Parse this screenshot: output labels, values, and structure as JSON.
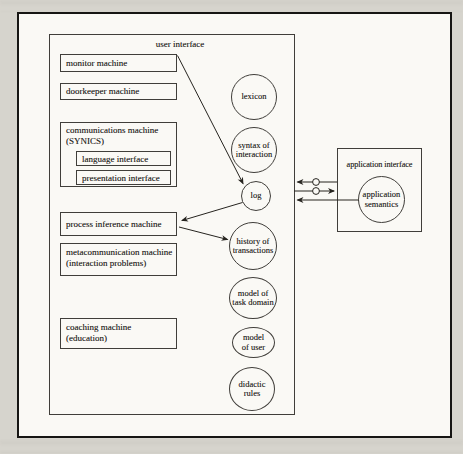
{
  "colors": {
    "ink": "#26241f",
    "paper": "#faf9f5",
    "margin": "#d6d4cd"
  },
  "user_interface": {
    "label": "user interface",
    "machines": {
      "monitor": {
        "line1": "monitor machine"
      },
      "doorkeeper": {
        "line1": "doorkeeper machine"
      },
      "communications": {
        "line1": "communications machine",
        "line2": "(SYNICS)"
      },
      "language": {
        "line1": "language interface"
      },
      "presentation": {
        "line1": "presentation interface"
      },
      "process_inference": {
        "line1": "process inference machine"
      },
      "metacommunication": {
        "line1": "metacommunication machine",
        "line2": "(interaction problems)"
      },
      "coaching": {
        "line1": "coaching machine",
        "line2": "(education)"
      }
    },
    "knowledge_stores": {
      "lexicon": {
        "line1": "lexicon"
      },
      "syntax": {
        "line1": "syntax of",
        "line2": "interaction"
      },
      "log": {
        "line1": "log"
      },
      "history": {
        "line1": "history of",
        "line2": "transactions"
      },
      "model_task": {
        "line1": "model of",
        "line2": "task domain"
      },
      "model_user": {
        "line1": "model",
        "line2": "of user"
      },
      "didactic": {
        "line1": "didactic",
        "line2": "rules"
      }
    }
  },
  "application_interface": {
    "label": "application interface",
    "semantics": {
      "line1": "application",
      "line2": "semantics"
    }
  }
}
